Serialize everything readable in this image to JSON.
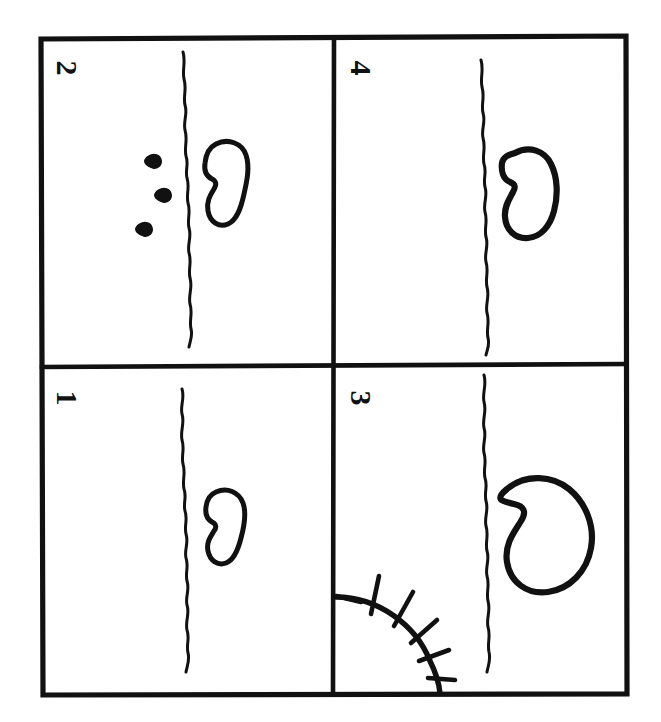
{
  "artwork": {
    "title": "Four-panel hand-drawn sequence",
    "medium": "pen-on-paper sketch",
    "background_color": "#ffffff",
    "ink_color": "#111111",
    "grid": {
      "rows": 2,
      "columns": 2,
      "outer_frame": {
        "x": 40,
        "y": 37,
        "width": 587,
        "height": 658
      },
      "vertical_divider_x": 333,
      "horizontal_divider_y": 366
    }
  },
  "panels": [
    {
      "id": "panel-2",
      "number_label": "2",
      "grid_position": "top-left",
      "number_rotation_degrees": 90,
      "number_position": {
        "x": 64,
        "y": 68
      },
      "bounds": {
        "x": 40,
        "y": 37,
        "width": 293,
        "height": 329
      },
      "elements": {
        "wavy_line": "present",
        "bean_shape": "medium",
        "droplets_count": 3,
        "sun": "absent"
      }
    },
    {
      "id": "panel-4",
      "number_label": "4",
      "grid_position": "top-right",
      "number_rotation_degrees": 90,
      "number_position": {
        "x": 358,
        "y": 68
      },
      "bounds": {
        "x": 333,
        "y": 37,
        "width": 294,
        "height": 329
      },
      "elements": {
        "wavy_line": "present",
        "bean_shape": "medium-large",
        "droplets_count": 0,
        "sun": "absent"
      }
    },
    {
      "id": "panel-1",
      "number_label": "1",
      "grid_position": "bottom-left",
      "number_rotation_degrees": 90,
      "number_position": {
        "x": 64,
        "y": 398
      },
      "bounds": {
        "x": 40,
        "y": 366,
        "width": 293,
        "height": 329
      },
      "elements": {
        "wavy_line": "present",
        "bean_shape": "small",
        "droplets_count": 0,
        "sun": "absent"
      }
    },
    {
      "id": "panel-3",
      "number_label": "3",
      "grid_position": "bottom-right",
      "number_rotation_degrees": 90,
      "number_position": {
        "x": 358,
        "y": 398
      },
      "bounds": {
        "x": 333,
        "y": 366,
        "width": 294,
        "height": 329
      },
      "elements": {
        "wavy_line": "present",
        "bean_shape": "large",
        "droplets_count": 0,
        "sun": "present-bottom-left-quarter",
        "sun_rays_count": 6
      }
    }
  ],
  "icons": {
    "wavy_line": "wavy-vertical-line-icon",
    "bean": "bean-seed-icon",
    "droplet": "water-droplet-icon",
    "sun": "sun-with-rays-icon"
  }
}
